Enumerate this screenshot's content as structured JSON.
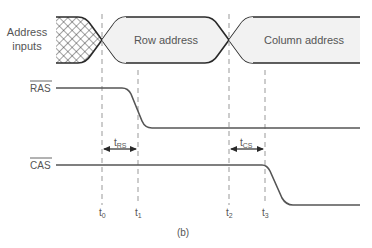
{
  "figure_label": "(b)",
  "signals": {
    "address": {
      "label_line1": "Address",
      "label_line2": "inputs",
      "segments": [
        "Row address",
        "Column address"
      ]
    },
    "ras": {
      "label": "RAS",
      "overbar": true
    },
    "cas": {
      "label": "CAS",
      "overbar": true
    }
  },
  "intervals": {
    "trs": {
      "main": "t",
      "sub": "RS"
    },
    "tcs": {
      "main": "t",
      "sub": "CS"
    }
  },
  "time_markers": [
    {
      "main": "t",
      "sub": "0"
    },
    {
      "main": "t",
      "sub": "1"
    },
    {
      "main": "t",
      "sub": "2"
    },
    {
      "main": "t",
      "sub": "3"
    }
  ],
  "colors": {
    "line": "#2a2a2a",
    "bus_fill": "#f2f2f2",
    "dash": "#999999",
    "text": "#555555"
  }
}
